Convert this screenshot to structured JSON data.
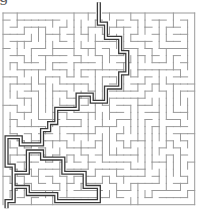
{
  "heading": {
    "partial_text": "g"
  },
  "maze": {
    "wall_color": "#9a9a9a",
    "solution_color": "#3a3a3a",
    "columns": 27,
    "rows": 27,
    "entry": "top",
    "exit": "bottom-left"
  }
}
